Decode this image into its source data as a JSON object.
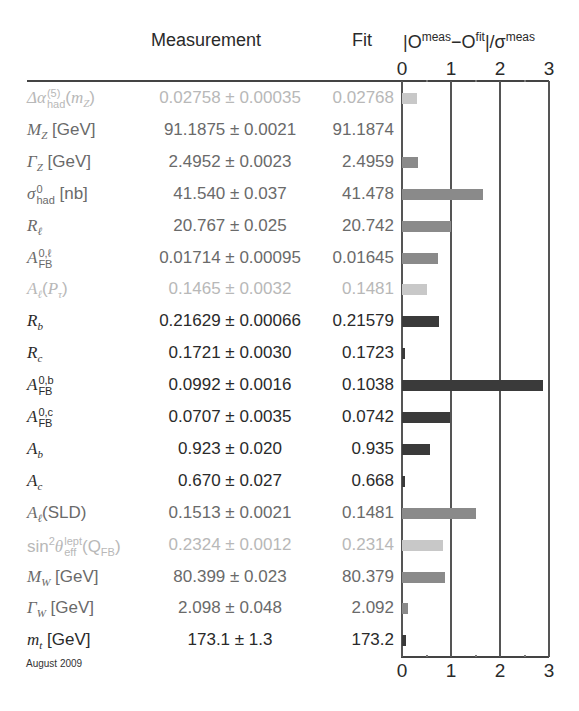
{
  "header": {
    "measurement": "Measurement",
    "fit": "Fit",
    "pull_label": "|O^meas−O^fit|/σ^meas",
    "pull_parts": {
      "O1": "|O",
      "sup1": "meas",
      "mid": "−O",
      "sup2": "fit",
      "end": "|/σ",
      "sup3": "meas"
    }
  },
  "axis": {
    "ticks": [
      "0",
      "1",
      "2",
      "3"
    ]
  },
  "footer": {
    "date": "August 2009"
  },
  "colors": {
    "light": "#b5b5b5",
    "mid": "#8a8a8a",
    "dark": "#3a3a3a",
    "lightest": "#c8c8c8"
  },
  "rows": [
    {
      "label": "Δα_had^(5)(m_Z)",
      "meas": "0.02758 ± 0.00035",
      "fit": "0.02768",
      "pull": 0.3,
      "shade": "lightest"
    },
    {
      "label": "M_Z [GeV]",
      "meas": "91.1875 ± 0.0021",
      "fit": "91.1874",
      "pull": 0.0,
      "shade": "mid"
    },
    {
      "label": "Γ_Z [GeV]",
      "meas": "2.4952 ± 0.0023",
      "fit": "2.4959",
      "pull": 0.32,
      "shade": "mid"
    },
    {
      "label": "σ_had^0 [nb]",
      "meas": "41.540 ± 0.037",
      "fit": "41.478",
      "pull": 1.65,
      "shade": "mid"
    },
    {
      "label": "R_l",
      "meas": "20.767 ± 0.025",
      "fit": "20.742",
      "pull": 1.0,
      "shade": "mid"
    },
    {
      "label": "A_FB^0,l",
      "meas": "0.01714 ± 0.00095",
      "fit": "0.01645",
      "pull": 0.73,
      "shade": "mid"
    },
    {
      "label": "A_l(P_τ)",
      "meas": "0.1465 ± 0.0032",
      "fit": "0.1481",
      "pull": 0.5,
      "shade": "lightest"
    },
    {
      "label": "R_b",
      "meas": "0.21629 ± 0.00066",
      "fit": "0.21579",
      "pull": 0.75,
      "shade": "dark"
    },
    {
      "label": "R_c",
      "meas": "0.1721 ± 0.0030",
      "fit": "0.1723",
      "pull": 0.07,
      "shade": "dark"
    },
    {
      "label": "A_FB^0,b",
      "meas": "0.0992 ± 0.0016",
      "fit": "0.1038",
      "pull": 2.87,
      "shade": "dark"
    },
    {
      "label": "A_FB^0,c",
      "meas": "0.0707 ± 0.0035",
      "fit": "0.0742",
      "pull": 0.98,
      "shade": "dark"
    },
    {
      "label": "A_b",
      "meas": "0.923 ± 0.020",
      "fit": "0.935",
      "pull": 0.58,
      "shade": "dark"
    },
    {
      "label": "A_c",
      "meas": "0.670 ± 0.027",
      "fit": "0.668",
      "pull": 0.07,
      "shade": "dark"
    },
    {
      "label": "A_l(SLD)",
      "meas": "0.1513 ± 0.0021",
      "fit": "0.1481",
      "pull": 1.5,
      "shade": "mid"
    },
    {
      "label": "sin²θ_eff^lept(Q_FB)",
      "meas": "0.2324 ± 0.0012",
      "fit": "0.2314",
      "pull": 0.83,
      "shade": "lightest"
    },
    {
      "label": "M_W [GeV]",
      "meas": "80.399 ± 0.023",
      "fit": "80.379",
      "pull": 0.87,
      "shade": "mid"
    },
    {
      "label": "Γ_W [GeV]",
      "meas": "2.098 ± 0.048",
      "fit": "2.092",
      "pull": 0.12,
      "shade": "mid"
    },
    {
      "label": "m_t [GeV]",
      "meas": "173.1 ± 1.3",
      "fit": "173.2",
      "pull": 0.08,
      "shade": "dark"
    }
  ],
  "chart_data": {
    "type": "bar",
    "orientation": "horizontal",
    "xlabel": "|O^meas−O^fit|/σ^meas",
    "ylabel": "",
    "xlim": [
      0,
      3
    ],
    "xticks": [
      0,
      1,
      2,
      3
    ],
    "grid": "vertical lines at 1, 2, 3",
    "categories": [
      "Δα_had^(5)(m_Z)",
      "M_Z [GeV]",
      "Γ_Z [GeV]",
      "σ_had^0 [nb]",
      "R_l",
      "A_FB^0,l",
      "A_l(P_τ)",
      "R_b",
      "R_c",
      "A_FB^0,b",
      "A_FB^0,c",
      "A_b",
      "A_c",
      "A_l(SLD)",
      "sin²θ_eff^lept(Q_FB)",
      "M_W [GeV]",
      "Γ_W [GeV]",
      "m_t [GeV]"
    ],
    "values": [
      0.3,
      0.0,
      0.32,
      1.65,
      1.0,
      0.73,
      0.5,
      0.75,
      0.07,
      2.87,
      0.98,
      0.58,
      0.07,
      1.5,
      0.83,
      0.87,
      0.12,
      0.08
    ],
    "table_columns": [
      "Measurement",
      "Fit"
    ],
    "annotation": "August 2009"
  }
}
